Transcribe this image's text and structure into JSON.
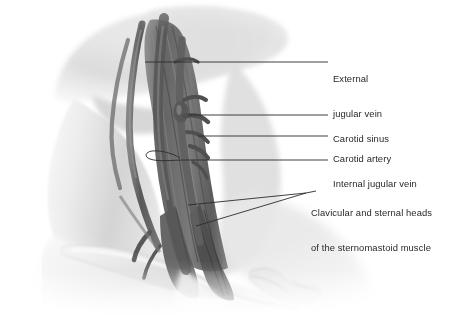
{
  "figure": {
    "background_color": "#ffffff",
    "width": 449,
    "height": 322,
    "style": "grayscale medical illustration"
  },
  "labels": [
    {
      "id": "external-jugular-vein",
      "line1": "External",
      "line2": "jugular vein",
      "text": "External jugular vein"
    },
    {
      "id": "carotid-sinus",
      "line1": "Carotid sinus",
      "line2": "",
      "text": "Carotid sinus"
    },
    {
      "id": "carotid-artery",
      "line1": "Carotid artery",
      "line2": "",
      "text": "Carotid artery"
    },
    {
      "id": "internal-jugular-vein",
      "line1": "Internal jugular vein",
      "line2": "",
      "text": "Internal jugular vein"
    },
    {
      "id": "sternomastoid-heads",
      "line1": "Clavicular and sternal heads",
      "line2": "of the sternomastoid muscle",
      "text": "Clavicular and sternal heads of the sternomastoid muscle"
    }
  ],
  "colors": {
    "text": "#282828",
    "leader_line": "#2b2b2b",
    "skin_light": "#f2f2f2",
    "skin_mid": "#d8d8d8",
    "skin_shadow": "#b4b4b4",
    "vessel_dark": "#4a4a4a",
    "vessel_mid": "#6d6d6d",
    "muscle_dark": "#555555",
    "bone_light": "#e6e6e6"
  }
}
